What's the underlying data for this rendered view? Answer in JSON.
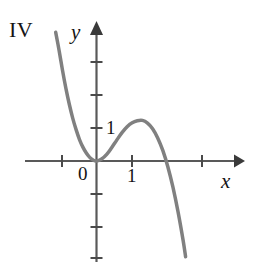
{
  "figure": {
    "panel_label": "IV",
    "background_color": "#ffffff",
    "width": 258,
    "height": 271
  },
  "axes": {
    "x_axis_label": "x",
    "y_axis_label": "y",
    "origin_label": "0",
    "x_tick_label": "1",
    "y_tick_label": "1",
    "axis_color": "#595959",
    "label_color": "#141414"
  },
  "chart_data": {
    "type": "line",
    "title": "IV",
    "xlabel": "x",
    "ylabel": "y",
    "grid": false,
    "legend": null,
    "xlim": [
      -2.1,
      4.3
    ],
    "ylim": [
      -4.2,
      4.2
    ],
    "x_ticks": [
      -1,
      0,
      1,
      3
    ],
    "x_tick_labels": [
      "",
      "0",
      "1",
      ""
    ],
    "y_ticks": [
      -3,
      -2,
      -1,
      1,
      2,
      3
    ],
    "y_tick_labels": [
      "",
      "",
      "",
      "1",
      "",
      ""
    ],
    "curve_color": "#808080",
    "curve_width": 3.5,
    "annotations": [
      "curve is tangent to the x-axis at the origin (double root at x = 0)",
      "local maximum slightly above y = 1 near x = 1.35",
      "curve crosses the x-axis near x = 2.1 and falls steeply"
    ],
    "series": [
      {
        "name": "y = f(x)",
        "x": [
          -1.2,
          -1.1,
          -1.0,
          -0.9,
          -0.8,
          -0.7,
          -0.6,
          -0.5,
          -0.4,
          -0.3,
          -0.2,
          -0.1,
          0.0,
          0.15,
          0.3,
          0.45,
          0.6,
          0.75,
          0.9,
          1.05,
          1.2,
          1.35,
          1.5,
          1.65,
          1.8,
          1.95,
          2.1,
          2.25,
          2.4,
          2.55,
          2.62
        ],
        "y": [
          3.9,
          3.35,
          2.75,
          2.2,
          1.72,
          1.3,
          0.95,
          0.65,
          0.42,
          0.24,
          0.11,
          0.03,
          0.0,
          0.06,
          0.2,
          0.41,
          0.64,
          0.86,
          1.04,
          1.16,
          1.22,
          1.23,
          1.15,
          0.98,
          0.7,
          0.32,
          -0.18,
          -0.8,
          -1.55,
          -2.42,
          -2.9
        ]
      }
    ]
  }
}
